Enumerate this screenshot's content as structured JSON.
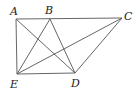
{
  "diagram": {
    "type": "geometry-figure",
    "stroke_color": "#555555",
    "label_color": "#222222",
    "points": {
      "A": {
        "label": "A",
        "x": 16,
        "y": 19
      },
      "B": {
        "label": "B",
        "x": 50,
        "y": 19
      },
      "C": {
        "label": "C",
        "x": 122,
        "y": 18
      },
      "D": {
        "label": "D",
        "x": 75,
        "y": 73
      },
      "E": {
        "label": "E",
        "x": 17,
        "y": 74
      }
    },
    "segments": [
      [
        "A",
        "C"
      ],
      [
        "A",
        "E"
      ],
      [
        "E",
        "D"
      ],
      [
        "D",
        "C"
      ],
      [
        "A",
        "D"
      ],
      [
        "B",
        "E"
      ],
      [
        "B",
        "D"
      ],
      [
        "E",
        "C"
      ]
    ]
  }
}
